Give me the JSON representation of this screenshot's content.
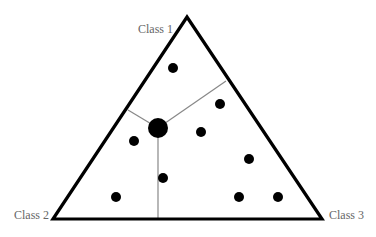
{
  "diagram": {
    "type": "ternary-voronoi",
    "vertices": [
      {
        "id": "class1",
        "label": "Class 1"
      },
      {
        "id": "class2",
        "label": "Class 2"
      },
      {
        "id": "class3",
        "label": "Class 3"
      }
    ],
    "colors": {
      "edge": "#000000",
      "divider": "#888888",
      "point": "#000000",
      "label": "#666666"
    },
    "point_count": 9,
    "centroid_count": 1
  }
}
